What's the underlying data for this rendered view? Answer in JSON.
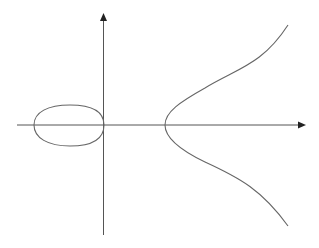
{
  "figure": {
    "components": [
      {
        "name": "oval",
        "kind": "closed"
      },
      {
        "name": "unbounded-branch",
        "kind": "open"
      }
    ],
    "axes": {
      "x_label": "",
      "y_label": ""
    },
    "colors": {
      "curve": "#666666",
      "axes": "#555555",
      "background": "#ffffff"
    }
  }
}
